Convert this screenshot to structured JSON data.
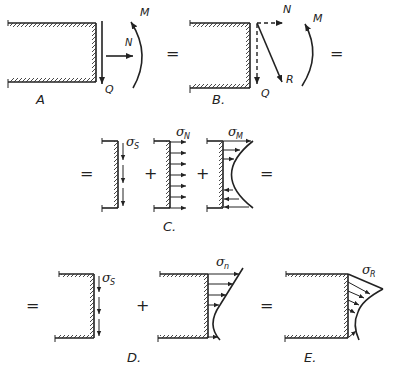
{
  "panels": {
    "A": {
      "caption": "A",
      "labels": {
        "moment": "M",
        "normal": "N",
        "shear": "Q"
      }
    },
    "B": {
      "caption": "B.",
      "labels": {
        "normal": "N",
        "moment": "M",
        "resultant": "R",
        "shear": "Q"
      }
    },
    "C": {
      "caption": "C.",
      "terms": [
        {
          "symbol": "σ",
          "subscript": "S"
        },
        {
          "symbol": "σ",
          "subscript": "N"
        },
        {
          "symbol": "σ",
          "subscript": "M"
        }
      ]
    },
    "D": {
      "caption": "D.",
      "terms": [
        {
          "symbol": "σ",
          "subscript": "S"
        },
        {
          "symbol": "σ",
          "subscript": "n"
        }
      ]
    },
    "E": {
      "caption": "E.",
      "terms": [
        {
          "symbol": "σ",
          "subscript": "R"
        }
      ]
    }
  },
  "operators": {
    "equals": "=",
    "plus": "+"
  }
}
